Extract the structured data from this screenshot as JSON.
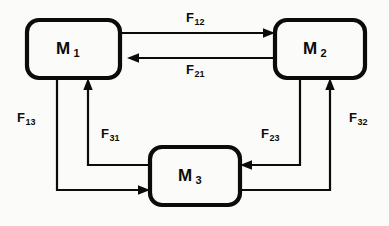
{
  "diagram": {
    "background_color": "#fbfbf9",
    "line_color": "#0b0b0b",
    "nodes": [
      {
        "id": "M1",
        "base": "M",
        "subscript": "1",
        "x": 27,
        "y": 20,
        "width": 93,
        "height": 58
      },
      {
        "id": "M2",
        "base": "M",
        "subscript": "2",
        "x": 275,
        "y": 20,
        "width": 90,
        "height": 58
      },
      {
        "id": "M3",
        "base": "M",
        "subscript": "3",
        "x": 150,
        "y": 147,
        "width": 90,
        "height": 58
      }
    ],
    "flows": [
      {
        "id": "F12",
        "base": "F",
        "subscript": "12",
        "from": "M1",
        "to": "M2",
        "label_x": 186,
        "label_y": 10
      },
      {
        "id": "F21",
        "base": "F",
        "subscript": "21",
        "from": "M2",
        "to": "M1",
        "label_x": 186,
        "label_y": 62
      },
      {
        "id": "F13",
        "base": "F",
        "subscript": "13",
        "from": "M1",
        "to": "M3",
        "label_x": 17,
        "label_y": 110
      },
      {
        "id": "F31",
        "base": "F",
        "subscript": "31",
        "from": "M3",
        "to": "M1",
        "label_x": 101,
        "label_y": 126
      },
      {
        "id": "F23",
        "base": "F",
        "subscript": "23",
        "from": "M2",
        "to": "M3",
        "label_x": 261,
        "label_y": 126
      },
      {
        "id": "F32",
        "base": "F",
        "subscript": "32",
        "from": "M3",
        "to": "M2",
        "label_x": 349,
        "label_y": 110
      }
    ]
  }
}
